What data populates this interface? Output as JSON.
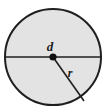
{
  "figure": {
    "name": "circle-diameter-radius-diagram",
    "type": "geometry-diagram",
    "background_color": "#ffffff",
    "canvas": {
      "width": 107,
      "height": 111
    },
    "circle": {
      "center_x": 53,
      "center_y": 57,
      "radius": 48,
      "fill_color": "#e3e3e3",
      "stroke_color": "#1f1f1f",
      "stroke_width": 2
    },
    "center_point": {
      "x": 53,
      "y": 57,
      "radius": 3.6,
      "color": "#111111"
    },
    "diameter_line": {
      "x1": 5,
      "y1": 57,
      "x2": 101,
      "y2": 57,
      "color": "#1f1f1f",
      "width": 1.6
    },
    "radius_line": {
      "x1": 53,
      "y1": 57,
      "x2": 84,
      "y2": 101,
      "color": "#1f1f1f",
      "width": 1.6
    },
    "labels": {
      "diameter": {
        "text": "d",
        "x": 50,
        "y": 51
      },
      "radius": {
        "text": "r",
        "x": 70,
        "y": 77
      }
    }
  },
  "chart_data": {
    "type": "diagram",
    "title": "",
    "annotations": [
      {
        "label": "d",
        "meaning": "diameter",
        "geometry": "horizontal chord through center"
      },
      {
        "label": "r",
        "meaning": "radius",
        "geometry": "segment from center to circumference"
      }
    ]
  }
}
